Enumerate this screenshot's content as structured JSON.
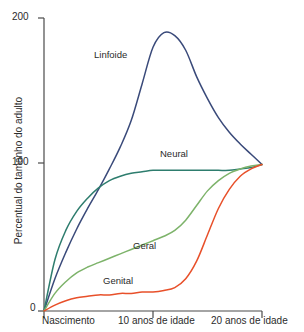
{
  "chart_data": {
    "type": "line",
    "title": "",
    "xlabel": "",
    "ylabel": "Percentual do tamanho do adulto",
    "xlim": [
      0,
      20
    ],
    "ylim": [
      0,
      200
    ],
    "grid": false,
    "legend_position": "inline-annotations",
    "y_ticks": [
      {
        "value": 200,
        "label": "200"
      },
      {
        "value": 100,
        "label": "100"
      },
      {
        "value": 0,
        "label": "0"
      }
    ],
    "x_ticks": [
      {
        "value": 0,
        "label": "Nascimento"
      },
      {
        "value": 10,
        "label": "10 anos de idade"
      },
      {
        "value": 20,
        "label": "20 anos de idade"
      }
    ],
    "x": [
      0,
      1,
      2,
      3,
      4,
      5,
      6,
      7,
      8,
      9,
      10,
      11,
      12,
      13,
      14,
      15,
      16,
      17,
      18,
      19,
      20
    ],
    "series": [
      {
        "name": "Linfoide",
        "color": "#3a4a7a",
        "label_position": {
          "x": 4.0,
          "y": 168
        },
        "values": [
          0,
          22,
          40,
          56,
          70,
          83,
          97,
          112,
          130,
          155,
          180,
          190,
          188,
          178,
          160,
          145,
          132,
          122,
          114,
          107,
          100
        ]
      },
      {
        "name": "Neural",
        "color": "#2e7d6e",
        "label_position": {
          "x": 11.0,
          "y": 112
        },
        "values": [
          0,
          35,
          55,
          68,
          77,
          84,
          89,
          92,
          94,
          95,
          96,
          96,
          96,
          96,
          96,
          96,
          96,
          96,
          97,
          98,
          100
        ]
      },
      {
        "name": "Geral",
        "color": "#7db36a",
        "label_position": {
          "x": 9.0,
          "y": 46
        },
        "values": [
          0,
          12,
          20,
          26,
          30,
          33,
          36,
          39,
          42,
          45,
          48,
          51,
          55,
          62,
          72,
          82,
          89,
          94,
          97,
          99,
          100
        ]
      },
      {
        "name": "Genital",
        "color": "#e8502a",
        "label_position": {
          "x": 5.0,
          "y": 22
        },
        "values": [
          0,
          4,
          7,
          9,
          10,
          11,
          11,
          12,
          12,
          13,
          13,
          14,
          16,
          22,
          34,
          52,
          70,
          83,
          92,
          97,
          100
        ]
      }
    ]
  }
}
